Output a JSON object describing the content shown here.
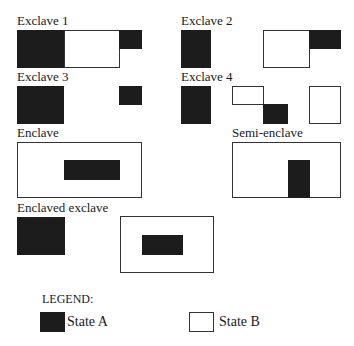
{
  "panels": {
    "exclave1": {
      "label": "Exclave 1"
    },
    "exclave2": {
      "label": "Exclave 2"
    },
    "exclave3": {
      "label": "Exclave 3"
    },
    "exclave4": {
      "label": "Exclave 4"
    },
    "enclave": {
      "label": "Enclave"
    },
    "semi_enclave": {
      "label": "Semi-enclave"
    },
    "enclaved_exclave": {
      "label": "Enclaved exclave"
    }
  },
  "legend": {
    "title": "LEGEND:",
    "items": [
      {
        "label": "State A",
        "color": "#1c1c1c"
      },
      {
        "label": "State B",
        "color": "#ffffff"
      }
    ]
  }
}
